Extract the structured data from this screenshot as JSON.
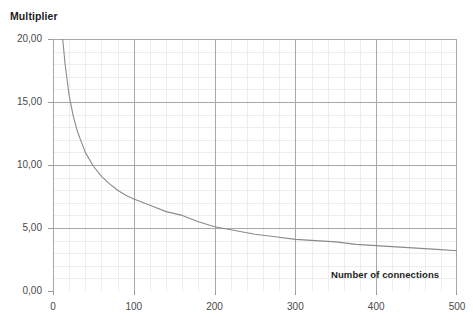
{
  "axes": {
    "y_title": "Multiplier",
    "x_title": "Number of connections",
    "y_ticks": [
      "0,00",
      "5,00",
      "10,00",
      "15,00",
      "20,00"
    ],
    "x_ticks": [
      "0",
      "100",
      "200",
      "300",
      "400",
      "500"
    ]
  },
  "colors": {
    "curve": "#8a8a8a",
    "major_grid": "#a8a8a8",
    "minor_grid": "#ededed",
    "axis_text": "#4a4a4a",
    "title_text": "#1d1d1d",
    "background": "#ffffff"
  },
  "chart_data": {
    "type": "line",
    "title": "",
    "xlabel": "Number of connections",
    "ylabel": "Multiplier",
    "xlim": [
      0,
      500
    ],
    "ylim": [
      0,
      20
    ],
    "grid": true,
    "legend": "none",
    "x_major_ticks": [
      0,
      100,
      200,
      300,
      400,
      500
    ],
    "y_major_ticks": [
      0,
      5,
      10,
      15,
      20
    ],
    "x_minor_interval": 20,
    "y_minor_interval": 1,
    "series": [
      {
        "name": "Multiplier",
        "x": [
          12,
          15,
          20,
          25,
          30,
          40,
          50,
          60,
          70,
          80,
          90,
          100,
          120,
          140,
          160,
          180,
          200,
          225,
          250,
          275,
          300,
          325,
          350,
          375,
          400,
          425,
          450,
          475,
          500
        ],
        "values": [
          20.0,
          18.0,
          15.5,
          13.9,
          12.7,
          11.0,
          9.9,
          9.1,
          8.5,
          8.0,
          7.6,
          7.3,
          6.8,
          6.3,
          6.0,
          5.5,
          5.1,
          4.8,
          4.5,
          4.3,
          4.1,
          4.0,
          3.9,
          3.7,
          3.6,
          3.5,
          3.4,
          3.3,
          3.2
        ]
      }
    ]
  }
}
